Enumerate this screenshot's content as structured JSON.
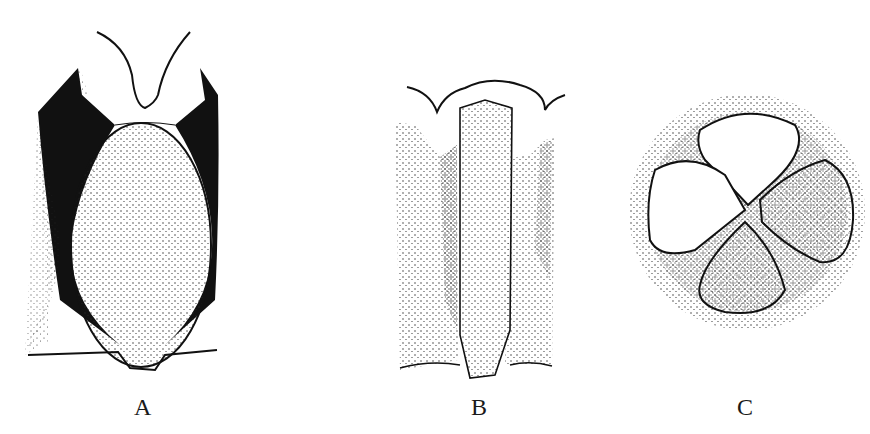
{
  "figure": {
    "panels": [
      {
        "id": "A",
        "label": "A"
      },
      {
        "id": "B",
        "label": "B"
      },
      {
        "id": "C",
        "label": "C"
      }
    ],
    "colors": {
      "ink": "#111111",
      "paper": "#ffffff"
    }
  }
}
